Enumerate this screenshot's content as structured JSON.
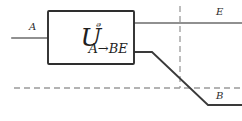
{
  "diagram": {
    "operator": {
      "base": "U",
      "superscript": "ᵊ",
      "superscript_name": "script-N",
      "subscript": "A→BE"
    },
    "wire_labels": {
      "input": "A",
      "output_top": "E",
      "output_bottom": "B"
    },
    "colors": {
      "wire": "#6b6b6b",
      "wire_dark": "#3a3a3a",
      "dashed": "#9a9a9a",
      "box_stroke": "#2e2e2e",
      "box_fill": "#ffffff",
      "text": "#2b2b2b",
      "background": "#ffffff"
    }
  }
}
